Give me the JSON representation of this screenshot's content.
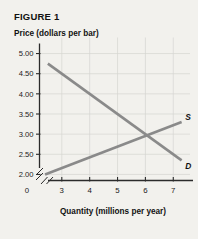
{
  "figure": {
    "title": "FIGURE 1"
  },
  "chart_data": {
    "type": "line",
    "title": "FIGURE 1",
    "xlabel": "Quantity (millions per year)",
    "ylabel": "Price (dollars per bar)",
    "xlim": [
      2.2,
      7.6
    ],
    "ylim": [
      1.85,
      5.15
    ],
    "grid": true,
    "legend_position": "inline-right",
    "x_ticks": [
      "0",
      "3",
      "4",
      "5",
      "6",
      "7"
    ],
    "x_tick_values": [
      0,
      3,
      4,
      5,
      6,
      7
    ],
    "y_ticks": [
      "2.00",
      "2.50",
      "3.00",
      "3.50",
      "4.00",
      "4.50",
      "5.00"
    ],
    "y_tick_values": [
      2.0,
      2.5,
      3.0,
      3.5,
      4.0,
      4.5,
      5.0
    ],
    "axis_break": true,
    "series": [
      {
        "name": "D",
        "label": "D",
        "color": "#8a8a8a",
        "points": [
          [
            2.5,
            4.75
          ],
          [
            7.3,
            2.35
          ]
        ]
      },
      {
        "name": "S",
        "label": "S",
        "color": "#8a8a8a",
        "points": [
          [
            2.4,
            2.0
          ],
          [
            7.3,
            3.3
          ]
        ]
      }
    ],
    "equilibrium": {
      "quantity": 6,
      "price": 3.0
    }
  }
}
